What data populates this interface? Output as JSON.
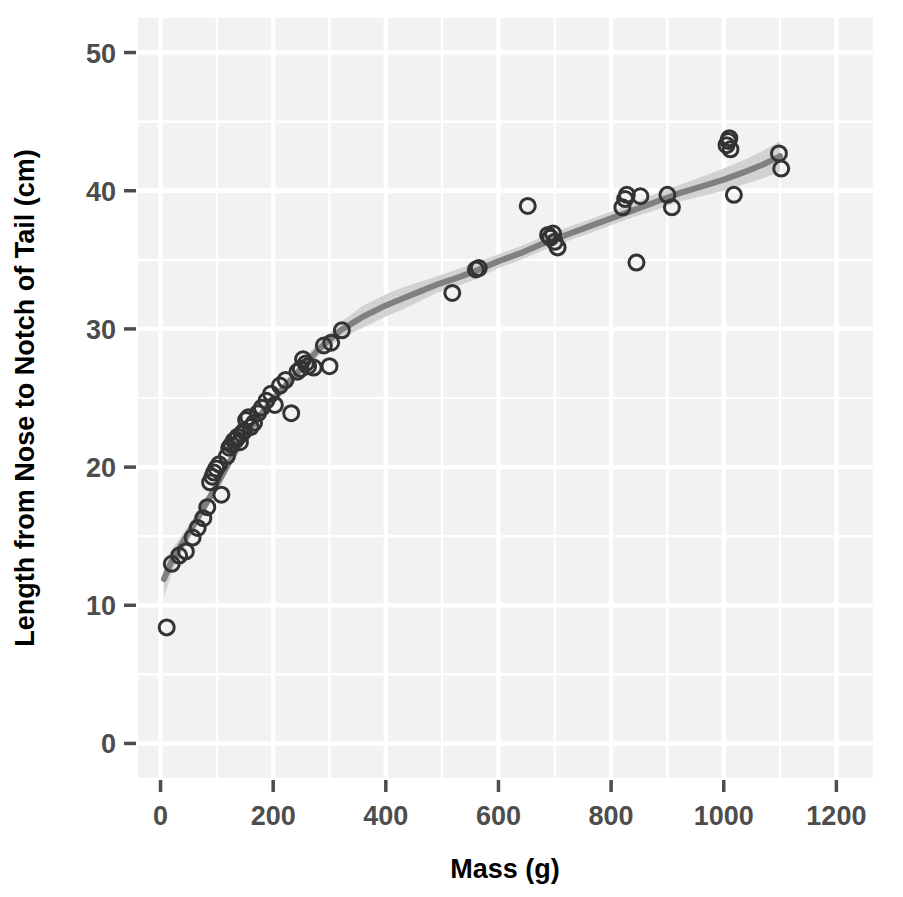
{
  "chart_data": {
    "type": "scatter",
    "title": "",
    "xlabel": "Mass (g)",
    "ylabel": "Length from Nose to Notch of Tail (cm)",
    "xlim": [
      -40,
      1265
    ],
    "ylim": [
      -2.5,
      52.5
    ],
    "xticks": [
      0,
      200,
      400,
      600,
      800,
      1000,
      1200
    ],
    "yticks": [
      0,
      10,
      20,
      30,
      40,
      50
    ],
    "xtick_labels": [
      "0",
      "200",
      "400",
      "600",
      "800",
      "1000",
      "1200"
    ],
    "ytick_labels": [
      "0",
      "10",
      "20",
      "30",
      "40",
      "50"
    ],
    "grid": true,
    "grid_color": "#ffffff",
    "panel_background": "#f2f2f2",
    "legend": "none",
    "series": [
      {
        "name": "Observations",
        "type": "scatter",
        "marker": "open-circle",
        "marker_color": "#333333",
        "points": [
          [
            11,
            8.4
          ],
          [
            20,
            13.0
          ],
          [
            33,
            13.6
          ],
          [
            45,
            13.9
          ],
          [
            57,
            14.9
          ],
          [
            66,
            15.6
          ],
          [
            76,
            16.3
          ],
          [
            83,
            17.1
          ],
          [
            88,
            18.9
          ],
          [
            92,
            19.3
          ],
          [
            95,
            19.6
          ],
          [
            99,
            19.9
          ],
          [
            104,
            20.2
          ],
          [
            108,
            18.0
          ],
          [
            118,
            20.8
          ],
          [
            122,
            21.4
          ],
          [
            126,
            21.6
          ],
          [
            130,
            21.9
          ],
          [
            134,
            22.0
          ],
          [
            137,
            22.2
          ],
          [
            141,
            21.8
          ],
          [
            144,
            22.4
          ],
          [
            148,
            22.6
          ],
          [
            152,
            23.4
          ],
          [
            156,
            23.6
          ],
          [
            160,
            22.9
          ],
          [
            166,
            23.2
          ],
          [
            173,
            23.9
          ],
          [
            180,
            24.3
          ],
          [
            188,
            24.8
          ],
          [
            196,
            25.3
          ],
          [
            203,
            24.5
          ],
          [
            212,
            25.9
          ],
          [
            222,
            26.3
          ],
          [
            232,
            23.9
          ],
          [
            243,
            26.9
          ],
          [
            249,
            27.1
          ],
          [
            253,
            27.8
          ],
          [
            258,
            27.5
          ],
          [
            262,
            27.3
          ],
          [
            272,
            27.2
          ],
          [
            290,
            28.8
          ],
          [
            300,
            27.3
          ],
          [
            303,
            29.0
          ],
          [
            322,
            29.9
          ],
          [
            518,
            32.6
          ],
          [
            560,
            34.3
          ],
          [
            565,
            34.4
          ],
          [
            652,
            38.9
          ],
          [
            688,
            36.8
          ],
          [
            692,
            36.6
          ],
          [
            697,
            36.9
          ],
          [
            700,
            36.3
          ],
          [
            705,
            35.9
          ],
          [
            820,
            38.8
          ],
          [
            825,
            39.4
          ],
          [
            828,
            39.7
          ],
          [
            845,
            34.8
          ],
          [
            852,
            39.6
          ],
          [
            900,
            39.7
          ],
          [
            908,
            38.8
          ],
          [
            1005,
            43.3
          ],
          [
            1008,
            43.6
          ],
          [
            1010,
            43.8
          ],
          [
            1012,
            43.0
          ],
          [
            1018,
            39.7
          ],
          [
            1098,
            42.7
          ],
          [
            1102,
            41.6
          ]
        ]
      },
      {
        "name": "Smoothed fit",
        "type": "line",
        "line_color": "#808080",
        "line_width": 6,
        "band_color": "#cccccc",
        "fit": [
          [
            6,
            11.9
          ],
          [
            20,
            13.2
          ],
          [
            40,
            14.6
          ],
          [
            60,
            15.9
          ],
          [
            80,
            17.3
          ],
          [
            100,
            18.7
          ],
          [
            120,
            20.2
          ],
          [
            140,
            21.6
          ],
          [
            160,
            22.8
          ],
          [
            180,
            23.9
          ],
          [
            200,
            24.9
          ],
          [
            220,
            25.8
          ],
          [
            240,
            26.7
          ],
          [
            260,
            27.6
          ],
          [
            280,
            28.5
          ],
          [
            300,
            29.2
          ],
          [
            320,
            29.9
          ],
          [
            340,
            30.4
          ],
          [
            360,
            30.9
          ],
          [
            380,
            31.3
          ],
          [
            400,
            31.7
          ],
          [
            430,
            32.2
          ],
          [
            460,
            32.7
          ],
          [
            490,
            33.2
          ],
          [
            520,
            33.6
          ],
          [
            560,
            34.2
          ],
          [
            600,
            34.9
          ],
          [
            640,
            35.5
          ],
          [
            680,
            36.2
          ],
          [
            720,
            36.8
          ],
          [
            760,
            37.4
          ],
          [
            800,
            38.0
          ],
          [
            840,
            38.6
          ],
          [
            880,
            39.2
          ],
          [
            920,
            39.8
          ],
          [
            960,
            40.3
          ],
          [
            1000,
            40.8
          ],
          [
            1040,
            41.4
          ],
          [
            1070,
            41.9
          ],
          [
            1100,
            42.5
          ]
        ],
        "band_upper": [
          [
            6,
            13.1
          ],
          [
            20,
            14.0
          ],
          [
            40,
            15.2
          ],
          [
            60,
            16.4
          ],
          [
            80,
            17.8
          ],
          [
            100,
            19.1
          ],
          [
            120,
            20.6
          ],
          [
            140,
            22.0
          ],
          [
            160,
            23.2
          ],
          [
            180,
            24.3
          ],
          [
            200,
            25.3
          ],
          [
            220,
            26.2
          ],
          [
            240,
            27.1
          ],
          [
            260,
            28.1
          ],
          [
            280,
            29.0
          ],
          [
            300,
            29.7
          ],
          [
            320,
            30.5
          ],
          [
            340,
            31.1
          ],
          [
            360,
            31.7
          ],
          [
            380,
            32.1
          ],
          [
            400,
            32.5
          ],
          [
            430,
            33.0
          ],
          [
            460,
            33.4
          ],
          [
            490,
            33.8
          ],
          [
            520,
            34.2
          ],
          [
            560,
            34.8
          ],
          [
            600,
            35.4
          ],
          [
            640,
            36.0
          ],
          [
            680,
            36.7
          ],
          [
            720,
            37.3
          ],
          [
            760,
            37.9
          ],
          [
            800,
            38.5
          ],
          [
            840,
            39.1
          ],
          [
            880,
            39.8
          ],
          [
            920,
            40.4
          ],
          [
            960,
            41.0
          ],
          [
            1000,
            41.6
          ],
          [
            1040,
            42.3
          ],
          [
            1070,
            42.9
          ],
          [
            1100,
            43.6
          ]
        ],
        "band_lower": [
          [
            6,
            10.6
          ],
          [
            20,
            12.3
          ],
          [
            40,
            14.0
          ],
          [
            60,
            15.4
          ],
          [
            80,
            16.8
          ],
          [
            100,
            18.3
          ],
          [
            120,
            19.8
          ],
          [
            140,
            21.2
          ],
          [
            160,
            22.4
          ],
          [
            180,
            23.5
          ],
          [
            200,
            24.5
          ],
          [
            220,
            25.4
          ],
          [
            240,
            26.3
          ],
          [
            260,
            27.1
          ],
          [
            280,
            28.0
          ],
          [
            300,
            28.7
          ],
          [
            320,
            29.3
          ],
          [
            340,
            29.7
          ],
          [
            360,
            30.1
          ],
          [
            380,
            30.5
          ],
          [
            400,
            30.9
          ],
          [
            430,
            31.4
          ],
          [
            460,
            32.0
          ],
          [
            490,
            32.6
          ],
          [
            520,
            33.0
          ],
          [
            560,
            33.6
          ],
          [
            600,
            34.4
          ],
          [
            640,
            35.0
          ],
          [
            680,
            35.7
          ],
          [
            720,
            36.3
          ],
          [
            760,
            36.9
          ],
          [
            800,
            37.5
          ],
          [
            840,
            38.1
          ],
          [
            880,
            38.6
          ],
          [
            920,
            39.2
          ],
          [
            960,
            39.6
          ],
          [
            1000,
            40.0
          ],
          [
            1040,
            40.5
          ],
          [
            1070,
            40.9
          ],
          [
            1100,
            41.4
          ]
        ]
      }
    ]
  }
}
